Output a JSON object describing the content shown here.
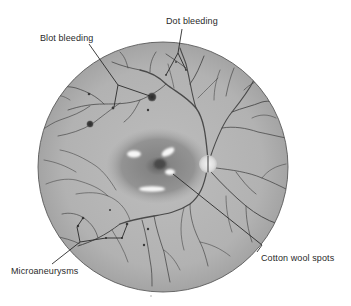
{
  "figure": {
    "labels": {
      "dot_bleeding": "Dot bleeding",
      "blot_bleeding": "Blot bleeding",
      "cotton_wool_spots": "Cotton wool spots",
      "microaneurysms": "Microaneurysms"
    },
    "colors": {
      "background": "#ffffff",
      "retina_fill": "#b4b4b4",
      "retina_edge": "#5a5a5a",
      "macula": "#8f8f8f",
      "fovea": "#4a4a4a",
      "optic_disc": "#e6e6e6",
      "vessels": "#4a4a4a",
      "lesion_spots": "#f5f5f5",
      "text": "#2a2a2a"
    }
  }
}
